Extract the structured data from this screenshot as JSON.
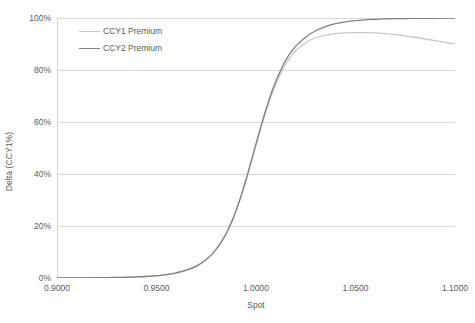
{
  "chart_data": {
    "type": "line",
    "title": "",
    "xlabel": "Spot",
    "ylabel": "Delta (CCY1%)",
    "xlim": [
      0.9,
      1.1
    ],
    "ylim": [
      0,
      1.0
    ],
    "grid": "horizontal",
    "legend_position": "inside-top-left",
    "x_tick_labels": [
      "0.9000",
      "0.9500",
      "1.0000",
      "1.0500",
      "1.1000"
    ],
    "x_tick_values": [
      0.9,
      0.95,
      1.0,
      1.05,
      1.1
    ],
    "y_tick_labels": [
      "0%",
      "20%",
      "40%",
      "60%",
      "80%",
      "100%"
    ],
    "y_tick_values": [
      0,
      0.2,
      0.4,
      0.6,
      0.8,
      1.0
    ],
    "x": [
      0.9,
      0.91,
      0.92,
      0.93,
      0.94,
      0.945,
      0.95,
      0.955,
      0.96,
      0.965,
      0.97,
      0.9725,
      0.975,
      0.9775,
      0.98,
      0.9825,
      0.985,
      0.9875,
      0.99,
      0.9925,
      0.995,
      0.9975,
      1.0,
      1.0025,
      1.005,
      1.0075,
      1.01,
      1.0125,
      1.015,
      1.0175,
      1.02,
      1.025,
      1.03,
      1.035,
      1.04,
      1.045,
      1.05,
      1.055,
      1.06,
      1.065,
      1.07,
      1.075,
      1.08,
      1.09,
      1.1
    ],
    "series": [
      {
        "name": "CCY1 Premium",
        "color": "#c9c9c9",
        "values": [
          0.0,
          0.0,
          0.001,
          0.002,
          0.004,
          0.006,
          0.009,
          0.013,
          0.02,
          0.03,
          0.046,
          0.057,
          0.071,
          0.088,
          0.11,
          0.137,
          0.17,
          0.21,
          0.258,
          0.313,
          0.375,
          0.442,
          0.51,
          0.577,
          0.64,
          0.697,
          0.746,
          0.788,
          0.823,
          0.851,
          0.874,
          0.905,
          0.924,
          0.934,
          0.94,
          0.943,
          0.944,
          0.944,
          0.943,
          0.94,
          0.936,
          0.931,
          0.926,
          0.913,
          0.9
        ]
      },
      {
        "name": "CCY2 Premium",
        "color": "#808080",
        "values": [
          0.0,
          0.0,
          0.001,
          0.002,
          0.004,
          0.006,
          0.009,
          0.013,
          0.02,
          0.03,
          0.046,
          0.057,
          0.071,
          0.089,
          0.111,
          0.138,
          0.171,
          0.212,
          0.26,
          0.316,
          0.379,
          0.447,
          0.516,
          0.584,
          0.648,
          0.707,
          0.758,
          0.801,
          0.838,
          0.868,
          0.892,
          0.927,
          0.951,
          0.967,
          0.978,
          0.985,
          0.99,
          0.993,
          0.995,
          0.997,
          0.998,
          0.998,
          0.999,
          0.999,
          1.0
        ]
      }
    ]
  },
  "legend": {
    "entries": [
      {
        "label": "CCY1 Premium"
      },
      {
        "label": "CCY2 Premium"
      }
    ]
  },
  "axes": {
    "y_title": "Delta (CCY1%)",
    "x_title": "Spot"
  },
  "colors": {
    "gridline": "#d9d9d9",
    "axis_line": "#d9d9d9",
    "text": "#595959",
    "background": "#ffffff"
  }
}
